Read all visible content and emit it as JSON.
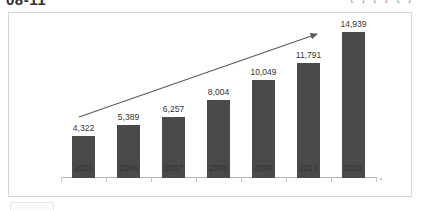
{
  "scan": {
    "header_title": "08-11",
    "header_right": "[ ] [ ] [ ]",
    "artifact_label": ""
  },
  "chart_data": {
    "type": "bar",
    "title": "",
    "subtitle": "",
    "xlabel": "",
    "ylabel": "",
    "categories": [
      "2005",
      "2006",
      "2007",
      "2008",
      "2009",
      "2010",
      "2011"
    ],
    "values": [
      4322,
      5389,
      6257,
      8004,
      10049,
      11791,
      14939
    ],
    "value_labels": [
      "4,322",
      "5,389",
      "6,257",
      "8,004",
      "10,049",
      "11,791",
      "14,939"
    ],
    "series": [
      {
        "name": "",
        "values": [
          4322,
          5389,
          6257,
          8004,
          10049,
          11791,
          14939
        ],
        "color": "#4a4a4a"
      }
    ],
    "ylim": [
      0,
      16000
    ],
    "grid": false,
    "legend": "none",
    "annotations": [
      {
        "type": "arrow",
        "label": "upward-trend-arrow",
        "from": [
          "2005",
          4322
        ],
        "to": [
          "2011",
          14939
        ],
        "color": "#5a5a5a"
      }
    ],
    "colors": {
      "bar": "#4a4a4a",
      "axis": "#b9b9b9",
      "text": "#333333",
      "panel_border": "#d8d8d8",
      "background": "#ffffff"
    }
  }
}
